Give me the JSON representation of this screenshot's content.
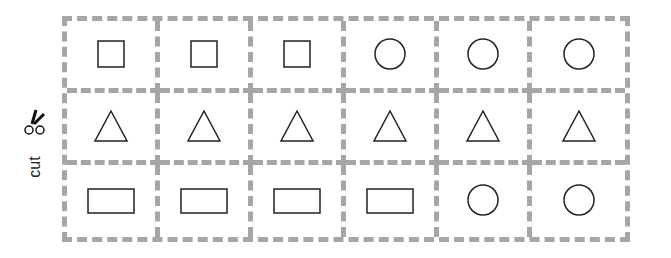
{
  "cut_label": "cut",
  "scissors_icon": "scissors-icon",
  "cells": [
    "square",
    "square",
    "square",
    "circle",
    "circle",
    "circle",
    "triangle",
    "triangle",
    "triangle",
    "triangle",
    "triangle",
    "triangle",
    "rectangle",
    "rectangle",
    "rectangle",
    "rectangle",
    "circle",
    "circle"
  ],
  "colors": {
    "dash": "#a6a6a6",
    "shape_stroke": "#222222"
  }
}
